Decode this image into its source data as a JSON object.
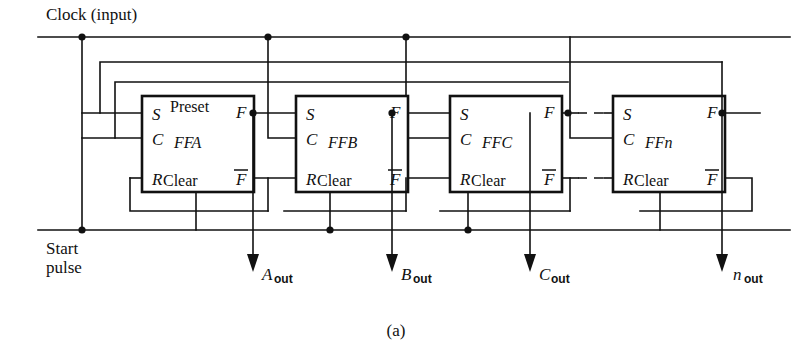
{
  "figure": {
    "caption": "(a)",
    "title_label": "Clock  (input)",
    "start_label_line1": "Start",
    "start_label_line2": "pulse"
  },
  "ports": {
    "s": "S",
    "c": "C",
    "r": "R",
    "f": "F",
    "fbar": "F",
    "preset": "Preset",
    "clear": "Clear"
  },
  "flipflops": [
    {
      "name": "FFA",
      "has_preset_label": true,
      "x": 142,
      "y": 96,
      "w": 112,
      "h": 96
    },
    {
      "name": "FFB",
      "has_preset_label": false,
      "x": 296,
      "y": 96,
      "w": 112,
      "h": 96
    },
    {
      "name": "FFC",
      "has_preset_label": false,
      "x": 450,
      "y": 96,
      "w": 112,
      "h": 96
    },
    {
      "name": "FFn",
      "has_preset_label": false,
      "x": 613,
      "y": 96,
      "w": 112,
      "h": 96
    }
  ],
  "outputs": [
    {
      "main": "A",
      "sub": "out",
      "x": 253
    },
    {
      "main": "B",
      "sub": "out",
      "x": 392
    },
    {
      "main": "C",
      "sub": "out",
      "x": 530
    },
    {
      "main": "n",
      "sub": "out",
      "x": 722
    }
  ],
  "wire_colors": {
    "line": "#111111",
    "background": "#ffffff"
  },
  "geometry": {
    "clock_line_y": 37,
    "feedback_outer_y": 62,
    "feedback_inner_y": 82,
    "s_y": 113,
    "c_y": 138,
    "r_y": 178,
    "fbar_return_y": 211,
    "start_line_y": 230
  }
}
